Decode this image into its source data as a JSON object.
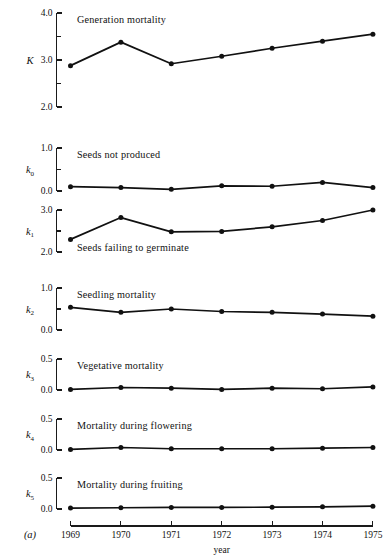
{
  "figure": {
    "label": "(a)",
    "xlabel": "year",
    "years": [
      "1969",
      "1970",
      "1971",
      "1972",
      "1973",
      "1974",
      "1975"
    ]
  },
  "chart_data": {
    "type": "line",
    "title": "",
    "xlabel": "year",
    "ylabel": "",
    "grid": false,
    "legend": "none",
    "x": [
      1969,
      1970,
      1971,
      1972,
      1973,
      1974,
      1975
    ],
    "categories": [
      "1969",
      "1970",
      "1971",
      "1972",
      "1973",
      "1974",
      "1975"
    ],
    "panels": [
      {
        "key": "K",
        "axis_label": "K",
        "axis_sub": "",
        "panel_title": "Generation mortality",
        "title_position": "above-line",
        "ylim": [
          2.0,
          4.0
        ],
        "yticks": [
          2.0,
          3.0,
          4.0
        ],
        "ytick_labels": [
          "2.0",
          "3.0",
          "4.0"
        ],
        "minor_yticks": [
          2.5,
          3.5
        ],
        "values": [
          2.88,
          3.38,
          2.92,
          3.08,
          3.25,
          3.4,
          3.55
        ]
      },
      {
        "key": "k0",
        "axis_label": "k",
        "axis_sub": "0",
        "panel_title": "Seeds not produced",
        "title_position": "above-line",
        "ylim": [
          0.0,
          1.0
        ],
        "yticks": [
          0.0,
          1.0
        ],
        "ytick_labels": [
          "0.0",
          "1.0"
        ],
        "minor_yticks": [
          0.5
        ],
        "values": [
          0.1,
          0.08,
          0.04,
          0.12,
          0.11,
          0.2,
          0.08
        ]
      },
      {
        "key": "k1",
        "axis_label": "k",
        "axis_sub": "1",
        "panel_title": "Seeds failing to germinate",
        "title_position": "below-line",
        "ylim": [
          2.0,
          3.0
        ],
        "yticks": [
          2.0,
          3.0
        ],
        "ytick_labels": [
          "2.0",
          "3.0"
        ],
        "minor_yticks": [
          2.5
        ],
        "values": [
          2.3,
          2.82,
          2.48,
          2.49,
          2.6,
          2.75,
          3.0
        ]
      },
      {
        "key": "k2",
        "axis_label": "k",
        "axis_sub": "2",
        "panel_title": "Seedling mortality",
        "title_position": "above-line",
        "ylim": [
          0.0,
          1.0
        ],
        "yticks": [
          0.0,
          1.0
        ],
        "ytick_labels": [
          "0.0",
          "1.0"
        ],
        "minor_yticks": [
          0.5
        ],
        "values": [
          0.54,
          0.42,
          0.5,
          0.44,
          0.42,
          0.38,
          0.33
        ]
      },
      {
        "key": "k3",
        "axis_label": "k",
        "axis_sub": "3",
        "panel_title": "Vegetative mortality",
        "title_position": "above-line",
        "ylim": [
          0.0,
          0.5
        ],
        "yticks": [
          0.0,
          0.5
        ],
        "ytick_labels": [
          "0.0",
          "0.5"
        ],
        "minor_yticks": [],
        "values": [
          0.01,
          0.04,
          0.03,
          0.01,
          0.03,
          0.02,
          0.05
        ]
      },
      {
        "key": "k4",
        "axis_label": "k",
        "axis_sub": "4",
        "panel_title": "Mortality during flowering",
        "title_position": "above-line",
        "ylim": [
          0.0,
          0.5
        ],
        "yticks": [
          0.0,
          0.5
        ],
        "ytick_labels": [
          "0.0",
          "0.5"
        ],
        "minor_yticks": [],
        "values": [
          0.01,
          0.04,
          0.02,
          0.02,
          0.02,
          0.03,
          0.04
        ]
      },
      {
        "key": "k5",
        "axis_label": "k",
        "axis_sub": "5",
        "panel_title": "Mortality during fruiting",
        "title_position": "above-line",
        "ylim": [
          0.0,
          0.5
        ],
        "yticks": [
          0.0,
          0.5
        ],
        "ytick_labels": [
          "0.0",
          "0.5"
        ],
        "minor_yticks": [],
        "values": [
          0.015,
          0.02,
          0.025,
          0.025,
          0.03,
          0.035,
          0.045
        ]
      }
    ]
  }
}
